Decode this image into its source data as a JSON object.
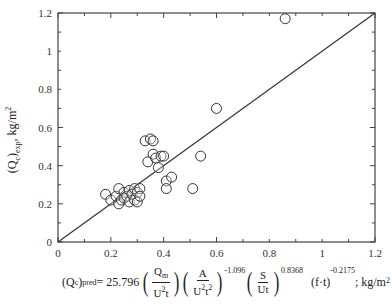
{
  "chart_data": {
    "type": "scatter",
    "title": "",
    "xlabel": "(Q_c)_pred = 25.796 (Q_m / U^2 t)(A / U^2 t^2)^-1.096 (S / Ut)^0.8368 (f·t)^-0.2175 ; kg/m^2",
    "ylabel": "(Q_c)_exp, kg/m^2",
    "xlim": [
      0,
      1.2
    ],
    "ylim": [
      0,
      1.2
    ],
    "x_ticks": [
      "0",
      "0.2",
      "0.4",
      "0.6",
      "0.8",
      "1",
      "1.2"
    ],
    "y_ticks": [
      "0",
      "0.2",
      "0.4",
      "0.6",
      "0.8",
      "1",
      "1.2"
    ],
    "grid": false,
    "legend": null,
    "reference_line": {
      "type": "y=x",
      "from": [
        0,
        0
      ],
      "to": [
        1.2,
        1.2
      ]
    },
    "series": [
      {
        "name": "data",
        "marker": "open-circle",
        "points": [
          [
            0.18,
            0.25
          ],
          [
            0.2,
            0.22
          ],
          [
            0.22,
            0.24
          ],
          [
            0.23,
            0.2
          ],
          [
            0.23,
            0.28
          ],
          [
            0.24,
            0.22
          ],
          [
            0.25,
            0.26
          ],
          [
            0.25,
            0.23
          ],
          [
            0.26,
            0.24
          ],
          [
            0.27,
            0.27
          ],
          [
            0.27,
            0.21
          ],
          [
            0.28,
            0.25
          ],
          [
            0.29,
            0.22
          ],
          [
            0.29,
            0.28
          ],
          [
            0.3,
            0.26
          ],
          [
            0.3,
            0.21
          ],
          [
            0.31,
            0.28
          ],
          [
            0.31,
            0.24
          ],
          [
            0.33,
            0.53
          ],
          [
            0.34,
            0.42
          ],
          [
            0.35,
            0.54
          ],
          [
            0.36,
            0.46
          ],
          [
            0.36,
            0.53
          ],
          [
            0.37,
            0.44
          ],
          [
            0.38,
            0.39
          ],
          [
            0.39,
            0.45
          ],
          [
            0.4,
            0.45
          ],
          [
            0.41,
            0.32
          ],
          [
            0.41,
            0.28
          ],
          [
            0.43,
            0.34
          ],
          [
            0.51,
            0.28
          ],
          [
            0.54,
            0.45
          ],
          [
            0.6,
            0.7
          ],
          [
            0.86,
            1.17
          ]
        ]
      }
    ]
  },
  "axes": {
    "ylabel_main": "(Q",
    "ylabel_sub_c": "c",
    "ylabel_close": ")",
    "ylabel_sub_exp": "exp",
    "ylabel_unit": ", kg/m",
    "ylabel_unit_sup": "2"
  },
  "formula": {
    "lhs": "(Q",
    "lhs_sub": "c",
    "lhs_close": ")",
    "lhs_pred": "pred",
    "eq": " = 25.796",
    "f1_num": "Q",
    "f1_num_sub": "m",
    "f1_den": "U",
    "f1_den_sup": "2",
    "f1_den_t": "t",
    "f2_num": "A",
    "f2_den": "U",
    "f2_den_sup": "2",
    "f2_den_t": "t",
    "f2_den_t_sup": "2",
    "f2_exp": "-1.096",
    "f3_num": "S",
    "f3_den": "Ut",
    "f3_exp": "0.8368",
    "f4": "(f·t)",
    "f4_exp": "-0.2175",
    "unit": "; kg/m",
    "unit_sup": "2"
  }
}
